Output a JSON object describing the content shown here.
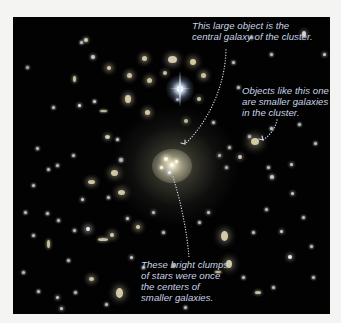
{
  "image": {
    "subject": "Galaxy cluster with annotated central galaxy",
    "background_color": "#f4f4f2",
    "sky_color": "#020203",
    "label_color": "#c9d4e4"
  },
  "annotations": [
    {
      "id": "central-galaxy",
      "text": "This large object is the\ncentral galaxy of the cluster."
    },
    {
      "id": "smaller-galaxies",
      "text": "Objects like this one\nare smaller galaxies\nin the cluster."
    },
    {
      "id": "bright-clumps",
      "text": "These bright clumps\nof stars were once\nthe centers of\nsmaller galaxies."
    }
  ],
  "objects": [
    {
      "x": 159,
      "y": 42,
      "w": 9,
      "h": 7,
      "c": "#e8dcc0",
      "glow": 6
    },
    {
      "x": 80,
      "y": 40,
      "w": 4,
      "h": 4,
      "c": "#d8d8e0",
      "glow": 3
    },
    {
      "x": 61,
      "y": 62,
      "w": 3,
      "h": 6,
      "c": "#d8cfa8",
      "glow": 3
    },
    {
      "x": 115,
      "y": 82,
      "w": 6,
      "h": 8,
      "c": "#e6dcb8",
      "glow": 5
    },
    {
      "x": 66,
      "y": 88,
      "w": 3,
      "h": 3,
      "c": "#ffffff",
      "glow": 3
    },
    {
      "x": 90,
      "y": 94,
      "w": 7,
      "h": 2,
      "c": "#cfc6a8",
      "glow": 2
    },
    {
      "x": 40,
      "y": 90,
      "w": 3,
      "h": 3,
      "c": "#cccccc",
      "glow": 2
    },
    {
      "x": 94,
      "y": 120,
      "w": 5,
      "h": 4,
      "c": "#e6e0c8",
      "glow": 4
    },
    {
      "x": 104,
      "y": 122,
      "w": 3,
      "h": 3,
      "c": "#d8d8d8",
      "glow": 2
    },
    {
      "x": 134,
      "y": 95,
      "w": 5,
      "h": 5,
      "c": "#e8dcb8",
      "glow": 5
    },
    {
      "x": 131,
      "y": 41,
      "w": 5,
      "h": 5,
      "c": "#e2d8b0",
      "glow": 5
    },
    {
      "x": 108,
      "y": 143,
      "w": 4,
      "h": 4,
      "c": "#cfcfcf",
      "glow": 2
    },
    {
      "x": 24,
      "y": 131,
      "w": 3,
      "h": 3,
      "c": "#cccccc",
      "glow": 2
    },
    {
      "x": 60,
      "y": 138,
      "w": 3,
      "h": 3,
      "c": "#cccccc",
      "glow": 2
    },
    {
      "x": 35,
      "y": 152,
      "w": 3,
      "h": 3,
      "c": "#cccccc",
      "glow": 2
    },
    {
      "x": 81,
      "y": 84,
      "w": 3,
      "h": 3,
      "c": "#dddddd",
      "glow": 2
    },
    {
      "x": 68,
      "y": 25,
      "w": 3,
      "h": 3,
      "c": "#cccccc",
      "glow": 2
    },
    {
      "x": 14,
      "y": 50,
      "w": 3,
      "h": 3,
      "c": "#bbbbbb",
      "glow": 2
    },
    {
      "x": 44,
      "y": 148,
      "w": 3,
      "h": 3,
      "c": "#c8c8c8",
      "glow": 2
    },
    {
      "x": 73,
      "y": 23,
      "w": 4,
      "h": 4,
      "c": "#e0d8c0",
      "glow": 3
    },
    {
      "x": 96,
      "y": 51,
      "w": 4,
      "h": 4,
      "c": "#e6dcb8",
      "glow": 5
    },
    {
      "x": 116,
      "y": 58,
      "w": 5,
      "h": 5,
      "c": "#dcd2b0",
      "glow": 5
    },
    {
      "x": 136,
      "y": 63,
      "w": 5,
      "h": 5,
      "c": "#e0d4a8",
      "glow": 5
    },
    {
      "x": 180,
      "y": 45,
      "w": 6,
      "h": 6,
      "c": "#e6dcb0",
      "glow": 6
    },
    {
      "x": 190,
      "y": 58,
      "w": 5,
      "h": 5,
      "c": "#dcd2a8",
      "glow": 5
    },
    {
      "x": 186,
      "y": 82,
      "w": 4,
      "h": 4,
      "c": "#ddd5b5",
      "glow": 4
    },
    {
      "x": 164,
      "y": 82,
      "w": 3,
      "h": 3,
      "c": "#cccccc",
      "glow": 3
    },
    {
      "x": 152,
      "y": 56,
      "w": 4,
      "h": 4,
      "c": "#d8d0b0",
      "glow": 4
    },
    {
      "x": 200,
      "y": 105,
      "w": 3,
      "h": 3,
      "c": "#cccccc",
      "glow": 2
    },
    {
      "x": 173,
      "y": 104,
      "w": 4,
      "h": 4,
      "c": "#ddd5b5",
      "glow": 4
    },
    {
      "x": 238,
      "y": 20,
      "w": 3,
      "h": 3,
      "c": "#cccccc",
      "glow": 2
    },
    {
      "x": 291,
      "y": 17,
      "w": 4,
      "h": 6,
      "c": "#e6e6e6",
      "glow": 4
    },
    {
      "x": 311,
      "y": 37,
      "w": 3,
      "h": 3,
      "c": "#dddddd",
      "glow": 3
    },
    {
      "x": 258,
      "y": 37,
      "w": 3,
      "h": 3,
      "c": "#cccccc",
      "glow": 2
    },
    {
      "x": 220,
      "y": 45,
      "w": 3,
      "h": 3,
      "c": "#cccccc",
      "glow": 2
    },
    {
      "x": 225,
      "y": 70,
      "w": 3,
      "h": 3,
      "c": "#cccccc",
      "glow": 2
    },
    {
      "x": 236,
      "y": 119,
      "w": 3,
      "h": 3,
      "c": "#cccccc",
      "glow": 2
    },
    {
      "x": 242,
      "y": 124,
      "w": 8,
      "h": 7,
      "c": "#e6dcb0",
      "glow": 8
    },
    {
      "x": 258,
      "y": 111,
      "w": 3,
      "h": 3,
      "c": "#dddddd",
      "glow": 2
    },
    {
      "x": 286,
      "y": 107,
      "w": 3,
      "h": 3,
      "c": "#cccccc",
      "glow": 2
    },
    {
      "x": 302,
      "y": 126,
      "w": 3,
      "h": 3,
      "c": "#cccccc",
      "glow": 2
    },
    {
      "x": 216,
      "y": 130,
      "w": 3,
      "h": 3,
      "c": "#cccccc",
      "glow": 2
    },
    {
      "x": 255,
      "y": 150,
      "w": 3,
      "h": 3,
      "c": "#cccccc",
      "glow": 2
    },
    {
      "x": 278,
      "y": 147,
      "w": 3,
      "h": 3,
      "c": "#dddddd",
      "glow": 3
    },
    {
      "x": 206,
      "y": 138,
      "w": 3,
      "h": 3,
      "c": "#dddddd",
      "glow": 3
    },
    {
      "x": 227,
      "y": 140,
      "w": 4,
      "h": 4,
      "c": "#e0d8c0",
      "glow": 4
    },
    {
      "x": 213,
      "y": 150,
      "w": 3,
      "h": 3,
      "c": "#cccccc",
      "glow": 2
    },
    {
      "x": 259,
      "y": 160,
      "w": 4,
      "h": 4,
      "c": "#dddddd",
      "glow": 3
    },
    {
      "x": 279,
      "y": 176,
      "w": 3,
      "h": 3,
      "c": "#dddddd",
      "glow": 3
    },
    {
      "x": 253,
      "y": 192,
      "w": 3,
      "h": 3,
      "c": "#cccccc",
      "glow": 2
    },
    {
      "x": 290,
      "y": 200,
      "w": 3,
      "h": 3,
      "c": "#cccccc",
      "glow": 2
    },
    {
      "x": 298,
      "y": 229,
      "w": 3,
      "h": 3,
      "c": "#cccccc",
      "glow": 2
    },
    {
      "x": 268,
      "y": 214,
      "w": 3,
      "h": 3,
      "c": "#dddddd",
      "glow": 3
    },
    {
      "x": 277,
      "y": 240,
      "w": 4,
      "h": 4,
      "c": "#ffffff",
      "glow": 4
    },
    {
      "x": 240,
      "y": 215,
      "w": 3,
      "h": 3,
      "c": "#cccccc",
      "glow": 2
    },
    {
      "x": 211,
      "y": 219,
      "w": 7,
      "h": 10,
      "c": "#e6dcb8",
      "glow": 7
    },
    {
      "x": 216,
      "y": 247,
      "w": 6,
      "h": 8,
      "c": "#e6dcb8",
      "glow": 7
    },
    {
      "x": 205,
      "y": 255,
      "w": 6,
      "h": 2,
      "c": "#d8d0b0",
      "glow": 2
    },
    {
      "x": 245,
      "y": 275,
      "w": 6,
      "h": 3,
      "c": "#d8d0b0",
      "glow": 3
    },
    {
      "x": 230,
      "y": 260,
      "w": 3,
      "h": 3,
      "c": "#cccccc",
      "glow": 2
    },
    {
      "x": 300,
      "y": 260,
      "w": 3,
      "h": 3,
      "c": "#cccccc",
      "glow": 2
    },
    {
      "x": 260,
      "y": 270,
      "w": 3,
      "h": 3,
      "c": "#cccccc",
      "glow": 2
    },
    {
      "x": 78,
      "y": 165,
      "w": 7,
      "h": 4,
      "c": "#e0d6b0",
      "glow": 5
    },
    {
      "x": 69,
      "y": 182,
      "w": 3,
      "h": 3,
      "c": "#dddddd",
      "glow": 3
    },
    {
      "x": 34,
      "y": 196,
      "w": 3,
      "h": 3,
      "c": "#cccccc",
      "glow": 2
    },
    {
      "x": 45,
      "y": 203,
      "w": 3,
      "h": 3,
      "c": "#cccccc",
      "glow": 2
    },
    {
      "x": 12,
      "y": 195,
      "w": 3,
      "h": 3,
      "c": "#cccccc",
      "glow": 2
    },
    {
      "x": 20,
      "y": 218,
      "w": 3,
      "h": 3,
      "c": "#cccccc",
      "glow": 2
    },
    {
      "x": 35,
      "y": 227,
      "w": 3,
      "h": 8,
      "c": "#d8cfa8",
      "glow": 3
    },
    {
      "x": 61,
      "y": 213,
      "w": 3,
      "h": 3,
      "c": "#cccccc",
      "glow": 2
    },
    {
      "x": 75,
      "y": 212,
      "w": 4,
      "h": 4,
      "c": "#ffffff",
      "glow": 5
    },
    {
      "x": 99,
      "y": 218,
      "w": 4,
      "h": 4,
      "c": "#e6dcb8",
      "glow": 5
    },
    {
      "x": 114,
      "y": 201,
      "w": 3,
      "h": 3,
      "c": "#dddddd",
      "glow": 3
    },
    {
      "x": 90,
      "y": 222,
      "w": 10,
      "h": 3,
      "c": "#d8d0b0",
      "glow": 3
    },
    {
      "x": 108,
      "y": 175,
      "w": 7,
      "h": 5,
      "c": "#e6dcb0",
      "glow": 6
    },
    {
      "x": 95,
      "y": 180,
      "w": 3,
      "h": 3,
      "c": "#cccccc",
      "glow": 2
    },
    {
      "x": 101,
      "y": 156,
      "w": 7,
      "h": 6,
      "c": "#e6dcb8",
      "glow": 6
    },
    {
      "x": 25,
      "y": 274,
      "w": 3,
      "h": 3,
      "c": "#cccccc",
      "glow": 2
    },
    {
      "x": 44,
      "y": 280,
      "w": 3,
      "h": 3,
      "c": "#dddddd",
      "glow": 3
    },
    {
      "x": 62,
      "y": 275,
      "w": 3,
      "h": 3,
      "c": "#cccccc",
      "glow": 2
    },
    {
      "x": 78,
      "y": 262,
      "w": 5,
      "h": 4,
      "c": "#e0d6b0",
      "glow": 5
    },
    {
      "x": 93,
      "y": 287,
      "w": 3,
      "h": 3,
      "c": "#cccccc",
      "glow": 2
    },
    {
      "x": 106,
      "y": 276,
      "w": 7,
      "h": 10,
      "c": "#e6dcb8",
      "glow": 7
    },
    {
      "x": 48,
      "y": 291,
      "w": 3,
      "h": 3,
      "c": "#dddddd",
      "glow": 3
    },
    {
      "x": 10,
      "y": 255,
      "w": 3,
      "h": 3,
      "c": "#cccccc",
      "glow": 2
    },
    {
      "x": 130,
      "y": 250,
      "w": 3,
      "h": 3,
      "c": "#cccccc",
      "glow": 2
    },
    {
      "x": 160,
      "y": 248,
      "w": 3,
      "h": 3,
      "c": "#cccccc",
      "glow": 2
    },
    {
      "x": 140,
      "y": 195,
      "w": 3,
      "h": 3,
      "c": "#dddddd",
      "glow": 3
    },
    {
      "x": 125,
      "y": 210,
      "w": 4,
      "h": 4,
      "c": "#e6dcb8",
      "glow": 5
    },
    {
      "x": 150,
      "y": 215,
      "w": 3,
      "h": 3,
      "c": "#cccccc",
      "glow": 2
    },
    {
      "x": 195,
      "y": 195,
      "w": 3,
      "h": 3,
      "c": "#dddddd",
      "glow": 3
    },
    {
      "x": 186,
      "y": 205,
      "w": 3,
      "h": 3,
      "c": "#cccccc",
      "glow": 2
    },
    {
      "x": 20,
      "y": 168,
      "w": 3,
      "h": 3,
      "c": "#cccccc",
      "glow": 2
    },
    {
      "x": 55,
      "y": 243,
      "w": 3,
      "h": 3,
      "c": "#cccccc",
      "glow": 2
    },
    {
      "x": 118,
      "y": 240,
      "w": 3,
      "h": 3,
      "c": "#dddddd",
      "glow": 3
    },
    {
      "x": 172,
      "y": 290,
      "w": 3,
      "h": 3,
      "c": "#cccccc",
      "glow": 2
    }
  ]
}
